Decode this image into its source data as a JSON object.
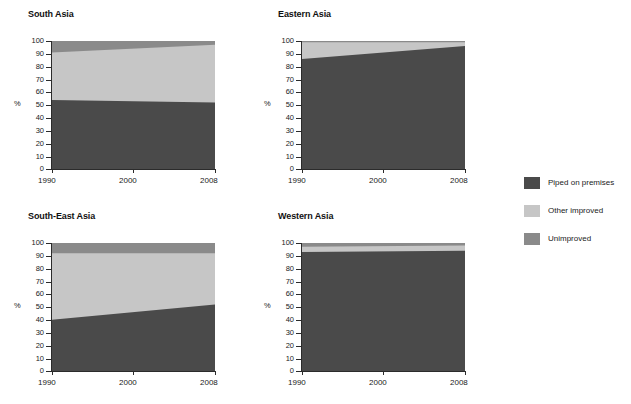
{
  "chart_data": {
    "type": "area",
    "title": "",
    "xlabel": "",
    "ylabel": "%",
    "xlim": [
      1990,
      2008
    ],
    "ylim": [
      0,
      100
    ],
    "x": [
      1990,
      2008
    ],
    "xticks": [
      1990,
      2000,
      2008
    ],
    "yticks": [
      0,
      10,
      20,
      30,
      40,
      50,
      60,
      70,
      80,
      90,
      100
    ],
    "grid": false,
    "stacked": true,
    "legend_position": "right",
    "legend": [
      "Piped on premises",
      "Other improved",
      "Unimproved"
    ],
    "colors": {
      "piped_on_premises": "#4a4a4a",
      "other_improved": "#c6c6c6",
      "unimproved": "#8a8a8a",
      "axis": "#2b2b2b",
      "text": "#1a1a1a",
      "background": "#ffffff"
    },
    "panels": [
      {
        "id": "south-asia",
        "title": "South Asia",
        "series": [
          {
            "name": "Piped on premises",
            "values": [
              54,
              52
            ]
          },
          {
            "name": "Other improved",
            "values": [
              37,
              45
            ]
          },
          {
            "name": "Unimproved",
            "values": [
              9,
              3
            ]
          }
        ],
        "cumulative": [
          {
            "name": "Piped on premises",
            "values": [
              54,
              52
            ]
          },
          {
            "name": "Other improved",
            "values": [
              91,
              97
            ]
          },
          {
            "name": "Unimproved",
            "values": [
              100,
              100
            ]
          }
        ]
      },
      {
        "id": "eastern-asia",
        "title": "Eastern Asia",
        "series": [
          {
            "name": "Piped on premises",
            "values": [
              86,
              96
            ]
          },
          {
            "name": "Other improved",
            "values": [
              13,
              3
            ]
          },
          {
            "name": "Unimproved",
            "values": [
              1,
              1
            ]
          }
        ],
        "cumulative": [
          {
            "name": "Piped on premises",
            "values": [
              86,
              96
            ]
          },
          {
            "name": "Other improved",
            "values": [
              99,
              99
            ]
          },
          {
            "name": "Unimproved",
            "values": [
              100,
              100
            ]
          }
        ]
      },
      {
        "id": "south-east-asia",
        "title": "South-East Asia",
        "series": [
          {
            "name": "Piped on premises",
            "values": [
              40,
              52
            ]
          },
          {
            "name": "Other improved",
            "values": [
              52,
              40
            ]
          },
          {
            "name": "Unimproved",
            "values": [
              8,
              8
            ]
          }
        ],
        "cumulative": [
          {
            "name": "Piped on premises",
            "values": [
              40,
              52
            ]
          },
          {
            "name": "Other improved",
            "values": [
              92,
              92
            ]
          },
          {
            "name": "Unimproved",
            "values": [
              100,
              100
            ]
          }
        ]
      },
      {
        "id": "western-asia",
        "title": "Western Asia",
        "series": [
          {
            "name": "Piped on premises",
            "values": [
              93,
              94
            ]
          },
          {
            "name": "Other improved",
            "values": [
              4,
              4
            ]
          },
          {
            "name": "Unimproved",
            "values": [
              3,
              2
            ]
          }
        ],
        "cumulative": [
          {
            "name": "Piped on premises",
            "values": [
              93,
              94
            ]
          },
          {
            "name": "Other improved",
            "values": [
              97,
              98
            ]
          },
          {
            "name": "Unimproved",
            "values": [
              100,
              100
            ]
          }
        ]
      }
    ]
  },
  "panels": {
    "south_asia": {
      "title": "South Asia"
    },
    "eastern_asia": {
      "title": "Eastern Asia"
    },
    "south_east_asia": {
      "title": "South-East Asia"
    },
    "western_asia": {
      "title": "Western Asia"
    }
  },
  "axis": {
    "unit": "%",
    "yticks": [
      "100",
      "90",
      "80",
      "70",
      "60",
      "50",
      "40",
      "30",
      "20",
      "10",
      "0"
    ],
    "xticks": [
      "1990",
      "2000",
      "2008"
    ]
  },
  "legend": {
    "items": [
      {
        "label": "Piped on premises",
        "color": "#4a4a4a"
      },
      {
        "label": "Other improved",
        "color": "#c6c6c6"
      },
      {
        "label": "Unimproved",
        "color": "#8a8a8a"
      }
    ]
  }
}
